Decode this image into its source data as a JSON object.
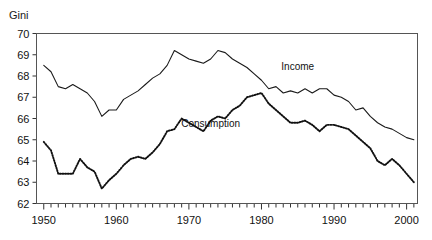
{
  "figure": {
    "cut_off_title": "",
    "axis_label_y": "Gini"
  },
  "chart_data": {
    "type": "line",
    "title": "",
    "xlabel": "",
    "ylabel": "Gini",
    "xlim": [
      1949,
      2001.5
    ],
    "ylim": [
      62,
      70
    ],
    "ytick_labels": [
      "62",
      "63",
      "64",
      "65",
      "66",
      "67",
      "68",
      "69",
      "70"
    ],
    "yticks": [
      62,
      63,
      64,
      65,
      66,
      67,
      68,
      69,
      70
    ],
    "xtick_labels": [
      "1950",
      "1960",
      "1970",
      "1980",
      "1990",
      "2000"
    ],
    "xticks_major": [
      1950,
      1960,
      1970,
      1980,
      1990,
      2000
    ],
    "xticks_minor_step": 1,
    "grid": false,
    "legend_position": "inline-on-curves",
    "x": [
      1950,
      1951,
      1952,
      1953,
      1954,
      1955,
      1956,
      1957,
      1958,
      1959,
      1960,
      1961,
      1962,
      1963,
      1964,
      1965,
      1966,
      1967,
      1968,
      1969,
      1970,
      1971,
      1972,
      1973,
      1974,
      1975,
      1976,
      1977,
      1978,
      1979,
      1980,
      1981,
      1982,
      1983,
      1984,
      1985,
      1986,
      1987,
      1988,
      1989,
      1990,
      1991,
      1992,
      1993,
      1994,
      1995,
      1996,
      1997,
      1998,
      1999,
      2000,
      2001
    ],
    "series": [
      {
        "name": "Income",
        "style": "solid",
        "values": [
          68.5,
          68.2,
          67.5,
          67.4,
          67.6,
          67.4,
          67.2,
          66.8,
          66.1,
          66.4,
          66.4,
          66.9,
          67.1,
          67.3,
          67.6,
          67.9,
          68.1,
          68.5,
          69.2,
          69.0,
          68.8,
          68.7,
          68.6,
          68.8,
          69.2,
          69.1,
          68.8,
          68.6,
          68.4,
          68.1,
          67.8,
          67.4,
          67.5,
          67.2,
          67.3,
          67.2,
          67.4,
          67.2,
          67.4,
          67.4,
          67.1,
          67.0,
          66.8,
          66.4,
          66.5,
          66.1,
          65.8,
          65.6,
          65.5,
          65.3,
          65.1,
          65.0
        ]
      },
      {
        "name": "Consumption",
        "style": "dotted",
        "values": [
          64.9,
          64.5,
          63.4,
          63.4,
          63.4,
          64.1,
          63.7,
          63.5,
          62.7,
          63.1,
          63.4,
          63.8,
          64.1,
          64.2,
          64.1,
          64.4,
          64.8,
          65.4,
          65.5,
          66.0,
          65.8,
          65.6,
          65.4,
          65.9,
          66.1,
          66.0,
          66.4,
          66.6,
          67.0,
          67.1,
          67.2,
          66.7,
          66.4,
          66.1,
          65.8,
          65.8,
          65.9,
          65.7,
          65.4,
          65.7,
          65.7,
          65.6,
          65.5,
          65.2,
          64.9,
          64.6,
          64.0,
          63.8,
          64.1,
          63.8,
          63.4,
          63.0
        ]
      }
    ],
    "annotations": [
      {
        "text": "Income",
        "x": 1985,
        "y": 68.3
      },
      {
        "text": "Consumption",
        "x": 1973,
        "y": 65.6
      }
    ]
  }
}
